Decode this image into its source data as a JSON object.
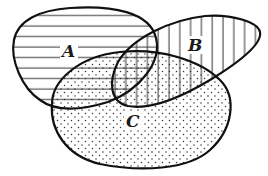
{
  "diagram": {
    "type": "venn",
    "sets": [
      {
        "id": "A",
        "label": "A",
        "fill_pattern": "horizontal-lines"
      },
      {
        "id": "B",
        "label": "B",
        "fill_pattern": "vertical-lines"
      },
      {
        "id": "C",
        "label": "C",
        "fill_pattern": "dots"
      }
    ],
    "colors": {
      "stroke": "#111111",
      "background": "#ffffff",
      "hatch": "#333333"
    }
  }
}
